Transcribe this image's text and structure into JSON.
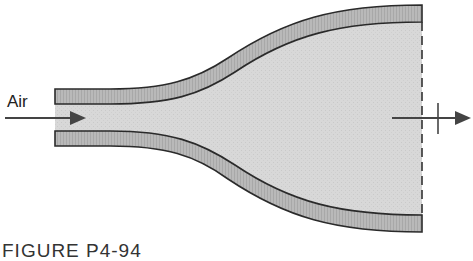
{
  "diagram": {
    "inlet_label": "Air",
    "caption": "FIGURE P4-94",
    "colors": {
      "wall_fill": "#b8b8b8",
      "flow_fill": "#d6d6d6",
      "outline": "#2a2a2a",
      "arrow": "#444444"
    }
  }
}
